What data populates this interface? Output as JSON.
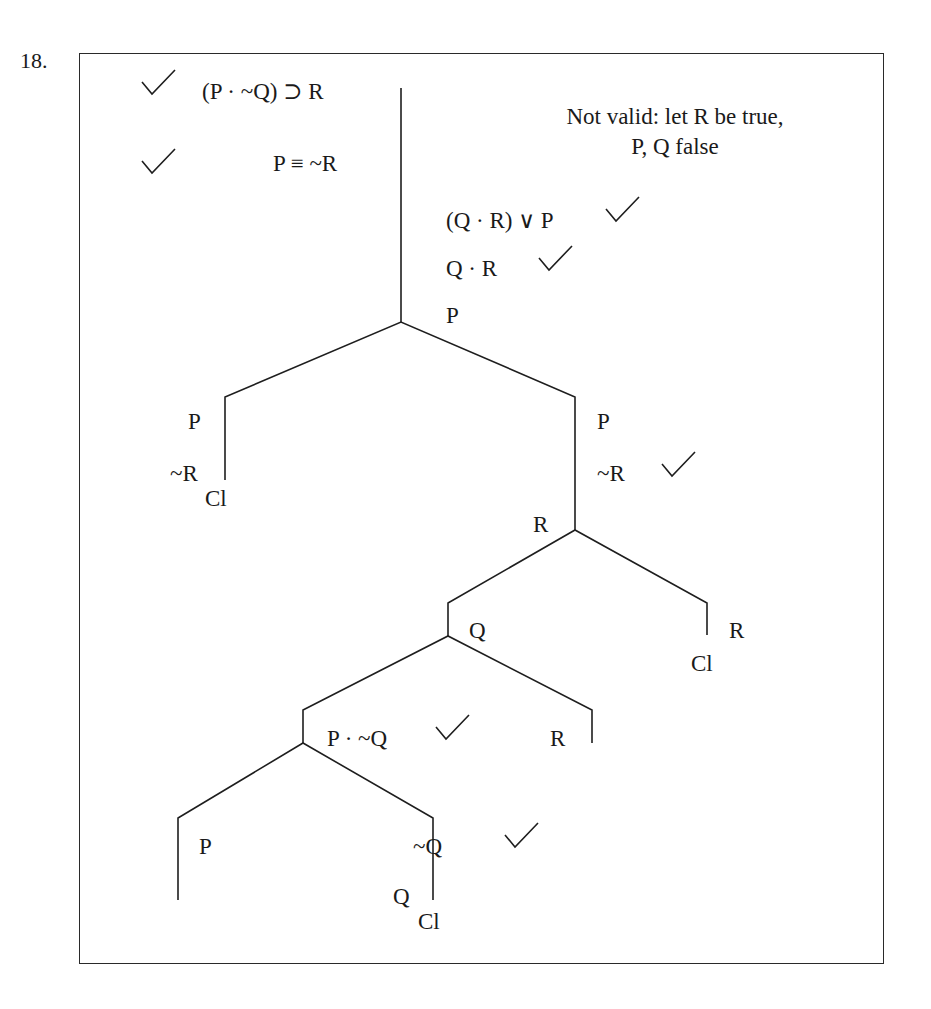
{
  "problem": {
    "number": "18."
  },
  "verdict": {
    "line1": "Not valid: let R be true,",
    "line2": "P, Q false"
  },
  "premises": [
    {
      "formula": "(P · ~Q) ⊃ R",
      "checked": true
    },
    {
      "formula": "P ≡ ~R",
      "checked": true
    }
  ],
  "trunk": [
    {
      "formula": "(Q · R) ∨ P",
      "checked": true
    },
    {
      "formula": "Q · R",
      "checked": true
    },
    {
      "formula": "P",
      "checked": false
    }
  ],
  "branches": {
    "split1_left": {
      "lines": [
        "P",
        "~R"
      ],
      "closed_label": "Cl"
    },
    "split1_right": {
      "lines": [
        "P",
        "~R"
      ],
      "checked_line": "~R",
      "after": "R"
    },
    "split2_left": {
      "line": "Q"
    },
    "split2_right": {
      "line": "R",
      "closed_label": "Cl"
    },
    "split3_left": {
      "formula": "P · ~Q",
      "checked": true
    },
    "split3_right": {
      "line": "R"
    },
    "split4_left": {
      "line": "P"
    },
    "split4_right": {
      "lines": [
        "~Q",
        "Q"
      ],
      "checked_line": "~Q",
      "closed_label": "Cl"
    }
  },
  "icons": {
    "check": "check-mark-icon"
  }
}
